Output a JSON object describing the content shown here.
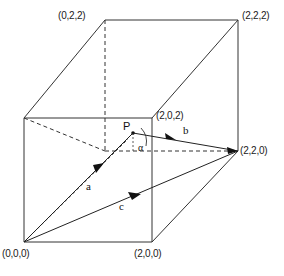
{
  "figure": {
    "type": "geometry-diagram",
    "canvas": {
      "width": 284,
      "height": 276
    },
    "background_color": "#ffffff",
    "line_color": "#333333",
    "vertices": [
      {
        "id": "origin",
        "label": "(0,0,0)",
        "x": 24,
        "y": 242,
        "label_x": 2,
        "label_y": 248,
        "hidden": false
      },
      {
        "id": "x-front",
        "label": "(2,0,0)",
        "x": 152,
        "y": 242,
        "label_x": 134,
        "label_y": 248,
        "hidden": false
      },
      {
        "id": "top-front-l",
        "label": "",
        "x": 24,
        "y": 118,
        "label_x": 0,
        "label_y": 0,
        "hidden": false
      },
      {
        "id": "top-front-r",
        "label": "(2,0,2)",
        "x": 152,
        "y": 118,
        "label_x": 156,
        "label_y": 110,
        "hidden": false
      },
      {
        "id": "back-top-l",
        "label": "(0,2,2)",
        "x": 105,
        "y": 20,
        "label_x": 58,
        "label_y": 10,
        "hidden": false
      },
      {
        "id": "back-top-r",
        "label": "(2,2,2)",
        "x": 238,
        "y": 20,
        "label_x": 242,
        "label_y": 10,
        "hidden": false
      },
      {
        "id": "back-bot-r",
        "label": "(2,2,0)",
        "x": 238,
        "y": 151,
        "label_x": 240,
        "label_y": 145,
        "hidden": false
      },
      {
        "id": "back-bot-l",
        "label": "",
        "x": 105,
        "y": 151,
        "label_x": 0,
        "label_y": 0,
        "hidden": true
      }
    ],
    "point_p": {
      "label": "P",
      "x": 133,
      "y": 133,
      "label_x": 123,
      "label_y": 120
    },
    "angle": {
      "label": "α",
      "x": 138,
      "y": 142
    },
    "vectors": [
      {
        "name": "a",
        "label": "a",
        "from_x": 24,
        "from_y": 242,
        "to_x": 133,
        "to_y": 133,
        "label_x": 86,
        "label_y": 180
      },
      {
        "name": "b",
        "label": "b",
        "from_x": 133,
        "from_y": 133,
        "to_x": 238,
        "to_y": 151,
        "label_x": 183,
        "label_y": 124
      },
      {
        "name": "c",
        "label": "c",
        "from_x": 24,
        "from_y": 242,
        "to_x": 238,
        "to_y": 151,
        "label_x": 119,
        "label_y": 200
      }
    ],
    "solid_edges": [
      {
        "x1": 24,
        "y1": 118,
        "x2": 152,
        "y2": 118
      },
      {
        "x1": 24,
        "y1": 118,
        "x2": 24,
        "y2": 242
      },
      {
        "x1": 152,
        "y1": 118,
        "x2": 152,
        "y2": 242
      },
      {
        "x1": 24,
        "y1": 242,
        "x2": 152,
        "y2": 242
      },
      {
        "x1": 24,
        "y1": 118,
        "x2": 105,
        "y2": 20
      },
      {
        "x1": 152,
        "y1": 118,
        "x2": 238,
        "y2": 20
      },
      {
        "x1": 105,
        "y1": 20,
        "x2": 238,
        "y2": 20
      },
      {
        "x1": 238,
        "y1": 20,
        "x2": 238,
        "y2": 151
      },
      {
        "x1": 152,
        "y1": 242,
        "x2": 238,
        "y2": 151
      }
    ],
    "dashed_edges": [
      {
        "x1": 105,
        "y1": 20,
        "x2": 105,
        "y2": 151
      },
      {
        "x1": 105,
        "y1": 151,
        "x2": 238,
        "y2": 151
      },
      {
        "x1": 24,
        "y1": 118,
        "x2": 105,
        "y2": 151
      },
      {
        "x1": 24,
        "y1": 242,
        "x2": 129,
        "y2": 138
      }
    ]
  }
}
